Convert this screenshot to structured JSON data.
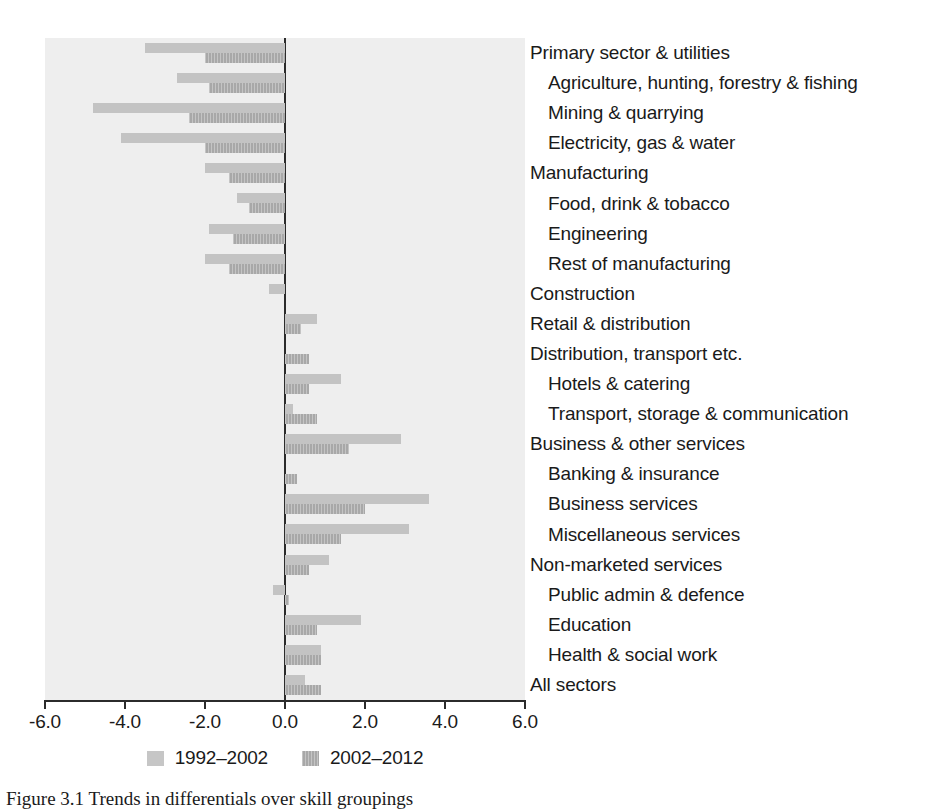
{
  "chart_data": {
    "type": "bar",
    "orientation": "horizontal",
    "title": "",
    "xlabel": "",
    "ylabel": "",
    "xlim": [
      -6.0,
      6.0
    ],
    "grid": false,
    "legend_position": "bottom",
    "xticks": [
      "-6.0",
      "-4.0",
      "-2.0",
      "0.0",
      "2.0",
      "4.0",
      "6.0"
    ],
    "xtick_values": [
      -6.0,
      -4.0,
      -2.0,
      0.0,
      2.0,
      4.0,
      6.0
    ],
    "categories": [
      "Primary sector & utilities",
      "Agriculture, hunting, forestry & fishing",
      "Mining & quarrying",
      "Electricity, gas & water",
      "Manufacturing",
      "Food, drink & tobacco",
      "Engineering",
      "Rest of manufacturing",
      "Construction",
      "Retail & distribution",
      "Distribution, transport etc.",
      "Hotels & catering",
      "Transport, storage & communication",
      "Business & other services",
      "Banking & insurance",
      "Business services",
      "Miscellaneous services",
      "Non-marketed services",
      "Public admin & defence",
      "Education",
      "Health & social work",
      "All sectors"
    ],
    "category_levels": [
      "top",
      "sub",
      "sub",
      "sub",
      "top",
      "sub",
      "sub",
      "sub",
      "top",
      "top",
      "top",
      "sub",
      "sub",
      "top",
      "sub",
      "sub",
      "sub",
      "top",
      "sub",
      "sub",
      "sub",
      "top"
    ],
    "series": [
      {
        "name": "1992–2002",
        "color": "#c3c3c3",
        "values": [
          -3.5,
          -2.7,
          -4.8,
          -4.1,
          -2.0,
          -1.2,
          -1.9,
          -2.0,
          -0.4,
          0.8,
          0.0,
          1.4,
          0.2,
          2.9,
          0.0,
          3.6,
          3.1,
          1.1,
          -0.3,
          1.9,
          0.9,
          0.5
        ]
      },
      {
        "name": "2002–2012",
        "color": "#a8a8a8",
        "values": [
          -2.0,
          -1.9,
          -2.4,
          -2.0,
          -1.4,
          -0.9,
          -1.3,
          -1.4,
          0.0,
          0.4,
          0.6,
          0.6,
          0.8,
          1.6,
          0.3,
          2.0,
          1.4,
          0.6,
          0.1,
          0.8,
          0.9,
          0.9
        ]
      }
    ]
  },
  "legend": {
    "items": [
      {
        "label": "1992–2002",
        "swatch": "light"
      },
      {
        "label": "2002–2012",
        "swatch": "dark"
      }
    ]
  },
  "caption": {
    "text": "Figure 3.1  Trends in differentials over skill groupings"
  }
}
